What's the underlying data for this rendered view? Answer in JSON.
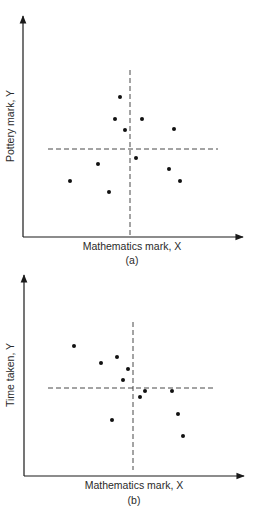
{
  "chart_data": [
    {
      "type": "scatter",
      "panel": "(a)",
      "title": "",
      "xlabel": "Mathematics mark, X",
      "ylabel": "Pottery mark, Y",
      "grid": false,
      "mean_lines": {
        "x_mean": 130,
        "y_mean": 149
      },
      "axes_px": {
        "origin": [
          23,
          237
        ],
        "x_end": 243,
        "y_end": 16
      },
      "points": [
        {
          "x": 120,
          "y": 97
        },
        {
          "x": 115,
          "y": 119
        },
        {
          "x": 142,
          "y": 119
        },
        {
          "x": 125,
          "y": 130
        },
        {
          "x": 174,
          "y": 129
        },
        {
          "x": 136,
          "y": 158
        },
        {
          "x": 98,
          "y": 164
        },
        {
          "x": 169,
          "y": 169
        },
        {
          "x": 70,
          "y": 181
        },
        {
          "x": 180,
          "y": 181
        },
        {
          "x": 109,
          "y": 192
        }
      ],
      "dashed_v": {
        "x": 130,
        "y1": 70,
        "y2": 237
      },
      "dashed_h": {
        "y": 149,
        "x1": 48,
        "x2": 218
      },
      "caption": "(a)"
    },
    {
      "type": "scatter",
      "panel": "(b)",
      "title": "",
      "xlabel": "Mathematics mark, X",
      "ylabel": "Time taken, Y",
      "grid": false,
      "mean_lines": {
        "x_mean": 133,
        "y_mean": 388
      },
      "axes_px": {
        "origin": [
          24,
          476
        ],
        "x_end": 244,
        "y_end": 275
      },
      "points": [
        {
          "x": 74,
          "y": 346
        },
        {
          "x": 101,
          "y": 363
        },
        {
          "x": 117,
          "y": 357
        },
        {
          "x": 128,
          "y": 369
        },
        {
          "x": 123,
          "y": 380
        },
        {
          "x": 145,
          "y": 391
        },
        {
          "x": 140,
          "y": 397
        },
        {
          "x": 172,
          "y": 391
        },
        {
          "x": 178,
          "y": 414
        },
        {
          "x": 112,
          "y": 420
        },
        {
          "x": 183,
          "y": 436
        }
      ],
      "dashed_v": {
        "x": 133,
        "y1": 322,
        "y2": 470
      },
      "dashed_h": {
        "y": 388,
        "x1": 48,
        "x2": 216
      },
      "caption": "(b)"
    }
  ],
  "labels": {
    "a": {
      "xlabel": "Mathematics mark, X",
      "ylabel": "Pottery mark, Y",
      "caption": "(a)"
    },
    "b": {
      "xlabel": "Mathematics mark, X",
      "ylabel": "Time taken, Y",
      "caption": "(b)"
    }
  }
}
